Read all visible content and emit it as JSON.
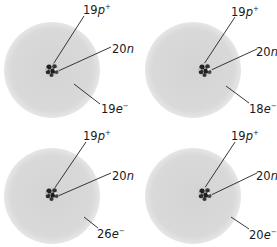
{
  "colors": {
    "cloud": "#d6d6d6",
    "nucleus_dark": "#222222",
    "nucleus_light": "#cfcfcf",
    "leader": "#222222",
    "text": "#1a1a1a"
  },
  "atoms": [
    {
      "id": "top-left",
      "protons": {
        "count": "19",
        "symbol": "p",
        "charge": "+"
      },
      "neutrons": {
        "count": "20",
        "symbol": "n"
      },
      "electrons": {
        "count": "19",
        "symbol": "e",
        "charge": "−"
      }
    },
    {
      "id": "top-right",
      "protons": {
        "count": "19",
        "symbol": "p",
        "charge": "+"
      },
      "neutrons": {
        "count": "20",
        "symbol": "n"
      },
      "electrons": {
        "count": "18",
        "symbol": "e",
        "charge": "−"
      }
    },
    {
      "id": "bottom-left",
      "protons": {
        "count": "19",
        "symbol": "p",
        "charge": "+"
      },
      "neutrons": {
        "count": "20",
        "symbol": "n"
      },
      "electrons": {
        "count": "26",
        "symbol": "e",
        "charge": "−"
      }
    },
    {
      "id": "bottom-right",
      "protons": {
        "count": "19",
        "symbol": "p",
        "charge": "+"
      },
      "neutrons": {
        "count": "20",
        "symbol": "n"
      },
      "electrons": {
        "count": "20",
        "symbol": "e",
        "charge": "−"
      }
    }
  ]
}
